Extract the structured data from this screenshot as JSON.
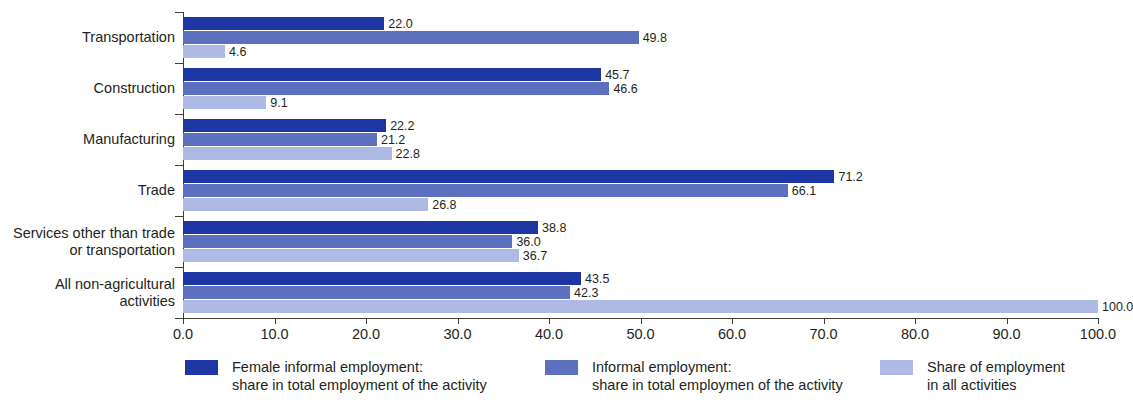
{
  "chart_data": {
    "type": "bar",
    "orientation": "horizontal",
    "title": "",
    "subtitle": "",
    "xlabel": "",
    "ylabel": "",
    "xlim": [
      0.0,
      100.0
    ],
    "xticks": [
      "0.0",
      "10.0",
      "20.0",
      "30.0",
      "40.0",
      "50.0",
      "60.0",
      "70.0",
      "80.0",
      "90.0",
      "100.0"
    ],
    "grid": false,
    "legend_position": "bottom",
    "categories": [
      "Transportation",
      "Construction",
      "Manufacturing",
      "Trade",
      "Services other than trade\nor transportation",
      "All non-agricultural\nactivities"
    ],
    "category_lines": [
      [
        "Transportation"
      ],
      [
        "Construction"
      ],
      [
        "Manufacturing"
      ],
      [
        "Trade"
      ],
      [
        "Services other than trade",
        "or transportation"
      ],
      [
        "All non-agricultural",
        "activities"
      ]
    ],
    "series": [
      {
        "name": "Female informal employment: share in total employment of the activity",
        "color": "#1d36a3",
        "values": [
          22.0,
          45.7,
          22.2,
          71.2,
          38.8,
          43.5
        ],
        "labels": [
          "22.0",
          "45.7",
          "22.2",
          "71.2",
          "38.8",
          "43.5"
        ]
      },
      {
        "name": "Informal employment: share in total employmen of the activity",
        "color": "#5c70bf",
        "values": [
          49.8,
          46.6,
          21.2,
          66.1,
          36.0,
          42.3
        ],
        "labels": [
          "49.8",
          "46.6",
          "21.2",
          "66.1",
          "36.0",
          "42.3"
        ]
      },
      {
        "name": "Share of employment in all activities",
        "color": "#aebae4",
        "values": [
          4.6,
          9.1,
          22.8,
          26.8,
          36.7,
          100.0
        ],
        "labels": [
          "4.6",
          "9.1",
          "22.8",
          "26.8",
          "36.7",
          "100.0"
        ]
      }
    ]
  },
  "legend": {
    "items": [
      {
        "swatch_color": "#1d36a3",
        "line1": "Female informal employment:",
        "line2": "share in total employment of the activity"
      },
      {
        "swatch_color": "#5c70bf",
        "line1": "Informal employment:",
        "line2": "share in total employmen of the activity"
      },
      {
        "swatch_color": "#aebae4",
        "line1": "Share of employment",
        "line2": "in all activities"
      }
    ]
  }
}
